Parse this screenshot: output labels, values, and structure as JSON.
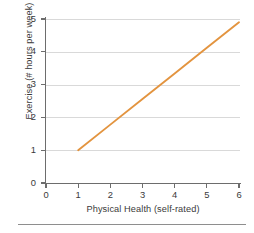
{
  "chart_data": {
    "type": "line",
    "title": "",
    "subtitle": "",
    "xlabel": "Physical Health (self-rated)",
    "ylabel": "Exercise (# hours per week)",
    "xlim": [
      0,
      6.4
    ],
    "ylim": [
      0,
      5.2
    ],
    "xticks": [
      "0",
      "1",
      "2",
      "3",
      "4",
      "5",
      "6"
    ],
    "xtick_values": [
      0,
      1,
      2,
      3,
      4,
      5,
      6
    ],
    "yticks": [
      "0",
      "1",
      "2",
      "3",
      "4",
      "5"
    ],
    "ytick_values": [
      0,
      1,
      2,
      3,
      4,
      5
    ],
    "grid": "horizontal",
    "legend": "none",
    "series": [
      {
        "name": "trend-line",
        "color": "#e3943f",
        "x": [
          1,
          6
        ],
        "values": [
          1,
          4.9
        ],
        "points": [
          {
            "x": 1,
            "y": 1
          },
          {
            "x": 2,
            "y": 1.78
          },
          {
            "x": 3,
            "y": 2.56
          },
          {
            "x": 4,
            "y": 3.34
          },
          {
            "x": 5,
            "y": 4.12
          },
          {
            "x": 6,
            "y": 4.9
          }
        ]
      }
    ]
  },
  "colors": {
    "line": "#e3943f",
    "gridline": "#d9d9d9",
    "axis": "#6d6d6d",
    "text": "#3a3a3a",
    "background": "#ffffff",
    "rule": "#8e8e8e"
  }
}
